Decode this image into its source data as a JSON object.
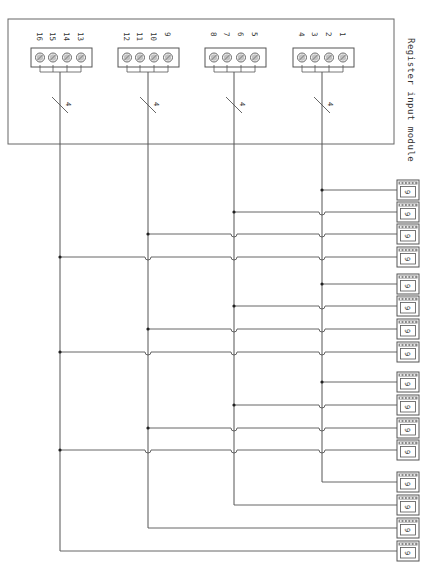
{
  "diagram": {
    "title": "Register input module",
    "colors": {
      "line": "#555555",
      "frame": "#666666",
      "text": "#333333",
      "screw_fill": "#999999",
      "background": "#ffffff"
    },
    "module_frame": {
      "x": 8,
      "y": 19,
      "w": 386,
      "h": 125
    },
    "terminal_blocks": [
      {
        "id": "block-1",
        "x": 293,
        "bus_x": 322,
        "bus_label": "4",
        "terminals": [
          "1",
          "2",
          "3",
          "4"
        ]
      },
      {
        "id": "block-2",
        "x": 205,
        "bus_x": 234,
        "bus_label": "4",
        "terminals": [
          "5",
          "6",
          "7",
          "8"
        ]
      },
      {
        "id": "block-3",
        "x": 118,
        "bus_x": 148,
        "bus_label": "4",
        "terminals": [
          "9",
          "10",
          "11",
          "12"
        ]
      },
      {
        "id": "block-4",
        "x": 31,
        "bus_x": 60,
        "bus_label": "4",
        "terminals": [
          "13",
          "14",
          "15",
          "16"
        ]
      }
    ],
    "buses_x": [
      322,
      234,
      148,
      60
    ],
    "devices": [
      {
        "index": 1,
        "y": 190,
        "bus": 0,
        "label": "9"
      },
      {
        "index": 2,
        "y": 212,
        "bus": 1,
        "label": "9"
      },
      {
        "index": 3,
        "y": 234,
        "bus": 2,
        "label": "9"
      },
      {
        "index": 4,
        "y": 257,
        "bus": 3,
        "label": "9"
      },
      {
        "index": 5,
        "y": 284,
        "bus": 0,
        "label": "9"
      },
      {
        "index": 6,
        "y": 306,
        "bus": 1,
        "label": "9"
      },
      {
        "index": 7,
        "y": 329,
        "bus": 2,
        "label": "9"
      },
      {
        "index": 8,
        "y": 352,
        "bus": 3,
        "label": "9"
      },
      {
        "index": 9,
        "y": 382,
        "bus": 0,
        "label": "9"
      },
      {
        "index": 10,
        "y": 405,
        "bus": 1,
        "label": "9"
      },
      {
        "index": 11,
        "y": 428,
        "bus": 2,
        "label": "9"
      },
      {
        "index": 12,
        "y": 450,
        "bus": 3,
        "label": "9"
      },
      {
        "index": 13,
        "y": 482,
        "bus": 0,
        "label": "9",
        "end": true
      },
      {
        "index": 14,
        "y": 505,
        "bus": 1,
        "label": "9",
        "end": true
      },
      {
        "index": 15,
        "y": 528,
        "bus": 2,
        "label": "9",
        "end": true
      },
      {
        "index": 16,
        "y": 551,
        "bus": 3,
        "label": "9",
        "end": true
      }
    ],
    "device_x": 397,
    "device_w": 22,
    "device_h": 20
  }
}
